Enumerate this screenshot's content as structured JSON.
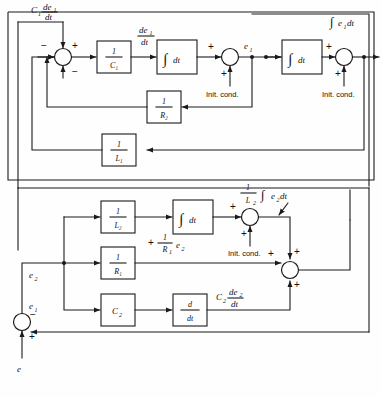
{
  "diagram": {
    "type": "control-system-block-diagram"
  },
  "upper_section": {
    "signal_labels": {
      "c1de1dt": "C₁ de₁/dt",
      "de1dt": "de₁/dt",
      "e1": "e₁",
      "integral_e1dt": "∫e₁dt"
    },
    "blocks": [
      {
        "name": "gain-1-over-C1",
        "num": "1",
        "den": "C₁"
      },
      {
        "name": "integrator-1",
        "glyph": "∫dt"
      },
      {
        "name": "integrator-2",
        "glyph": "∫dt"
      },
      {
        "name": "feedback-1-over-R2",
        "num": "1",
        "den": "R₂"
      },
      {
        "name": "feedback-1-over-L1",
        "num": "1",
        "den": "L₁"
      }
    ],
    "summing_junctions": [
      {
        "name": "sum-junction-1",
        "signs": [
          "-",
          "+",
          "-"
        ]
      },
      {
        "name": "sum-junction-e1",
        "signs": [
          "+",
          "+"
        ]
      },
      {
        "name": "sum-junction-integral-e1",
        "signs": [
          "+",
          "+"
        ]
      }
    ],
    "init_cond_labels": [
      "Init. cond.",
      "Init. cond."
    ]
  },
  "lower_section": {
    "signal_labels": {
      "e2": "e₂",
      "e1": "e₁",
      "e": "e",
      "integral_e2": "∫ e₂dt",
      "one_over_L2": "1/L₂",
      "r1_branch": "+ (1/R₁) e₂",
      "r1_branch_plus": "+",
      "r1_num": "1",
      "r1_den": "R₁",
      "r1_var": "e₂",
      "c2de2dt_pre": "C₂",
      "c2de2dt_num": "de₂",
      "c2de2dt_den": "dt"
    },
    "blocks": [
      {
        "name": "gain-1-over-L2",
        "num": "1",
        "den": "L₂"
      },
      {
        "name": "integrator-3",
        "glyph": "∫dt"
      },
      {
        "name": "gain-1-over-R1",
        "num": "1",
        "den": "R₁"
      },
      {
        "name": "gain-C2",
        "label": "C₂"
      },
      {
        "name": "differentiator",
        "num": "d",
        "den": "dt"
      }
    ],
    "summing_junctions": [
      {
        "name": "sum-junction-integral-e2",
        "signs": [
          "+",
          "+"
        ]
      },
      {
        "name": "sum-junction-output",
        "signs": [
          "+",
          "+",
          "+"
        ]
      },
      {
        "name": "sum-junction-input-e",
        "signs": [
          "+",
          "-"
        ]
      }
    ],
    "init_cond_labels": [
      "Init. cond."
    ]
  },
  "colors": {
    "line": "#1a1a1a",
    "background": "#fefefe",
    "text": "#111111"
  }
}
